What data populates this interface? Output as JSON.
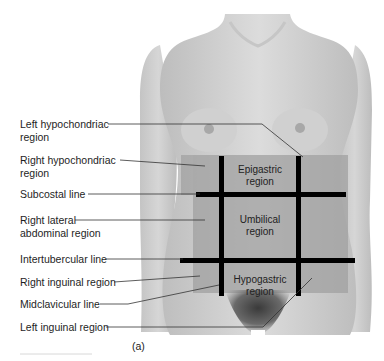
{
  "figure": {
    "caption": "(a)"
  },
  "labels": [
    {
      "id": "left-hypochondriac-region",
      "lines": [
        "Left hypochondriac",
        "region"
      ]
    },
    {
      "id": "right-hypochondriac-region",
      "lines": [
        "Right hypochondriac",
        "region"
      ]
    },
    {
      "id": "subcostal-line",
      "lines": [
        "Subcostal line"
      ]
    },
    {
      "id": "right-lateral-abdominal-region",
      "lines": [
        "Right lateral",
        "abdominal region"
      ]
    },
    {
      "id": "intertubercular-line",
      "lines": [
        "Intertubercular line"
      ]
    },
    {
      "id": "right-inguinal-region",
      "lines": [
        "Right inguinal region"
      ]
    },
    {
      "id": "midclavicular-line",
      "lines": [
        "Midclavicular line"
      ]
    },
    {
      "id": "left-inguinal-region",
      "lines": [
        "Left inguinal region"
      ]
    }
  ],
  "regions": [
    {
      "id": "epigastric-region",
      "lines": [
        "Epigastric",
        "region"
      ]
    },
    {
      "id": "umbilical-region",
      "lines": [
        "Umbilical",
        "region"
      ]
    },
    {
      "id": "hypogastric-region",
      "lines": [
        "Hypogastric",
        "region"
      ]
    }
  ],
  "colors": {
    "skin_light": "#d9d9d9",
    "skin_mid": "#bdbdbd",
    "region_overlay": "#9a9a9a",
    "grid_line": "#000000",
    "leader_line": "#333333",
    "text": "#1e1e1e"
  }
}
